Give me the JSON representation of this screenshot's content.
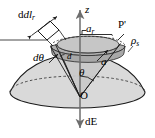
{
  "figure": {
    "caption_title": "Hemispherical surface charge geometry",
    "background_color": "#ffffff",
    "stroke_color": "#1a1a1a",
    "dome_fill": "#d8d8d8",
    "band_fill": "#b4b4b4",
    "cone_fill": "#c4c4c4",
    "patch_fill": "#ffffff",
    "axis_color": "#707070"
  },
  "labels": {
    "z_axis": "z",
    "dl_r": "dl",
    "dl_r_sub": "r",
    "a_r": "a",
    "a_r_sub": "r",
    "p_prime": "P'",
    "rho_s": "ρ",
    "rho_s_sub": "s",
    "d_theta": "dθ",
    "d_small": "d",
    "a": "a",
    "theta": "θ",
    "origin": "O",
    "dE": "dE"
  },
  "icons": {
    "arrow_up": "arrow-up-icon",
    "arrow_down": "arrow-down-icon",
    "double_arrow": "double-arrow-icon",
    "right_angle": "right-angle-mark-icon"
  }
}
